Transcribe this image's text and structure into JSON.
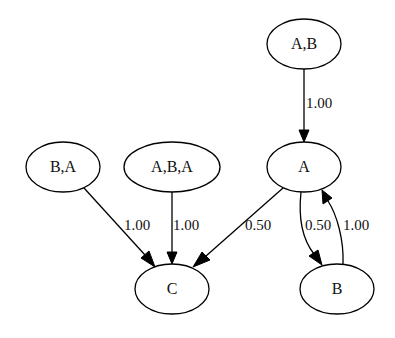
{
  "graph": {
    "type": "directed-weighted",
    "nodes": [
      {
        "id": "AB",
        "label": "A,B",
        "cx": 304,
        "cy": 44,
        "rx": 37,
        "ry": 25
      },
      {
        "id": "A",
        "label": "A",
        "cx": 304,
        "cy": 167,
        "rx": 37,
        "ry": 25
      },
      {
        "id": "BA",
        "label": "B,A",
        "cx": 63,
        "cy": 167,
        "rx": 37,
        "ry": 25
      },
      {
        "id": "ABA",
        "label": "A,B,A",
        "cx": 172,
        "cy": 167,
        "rx": 48,
        "ry": 25
      },
      {
        "id": "C",
        "label": "C",
        "cx": 172,
        "cy": 289,
        "rx": 37,
        "ry": 25
      },
      {
        "id": "B",
        "label": "B",
        "cx": 337,
        "cy": 289,
        "rx": 37,
        "ry": 25
      }
    ],
    "edges": [
      {
        "from": "A,B",
        "to": "A",
        "weight": "1.00"
      },
      {
        "from": "B,A",
        "to": "C",
        "weight": "1.00"
      },
      {
        "from": "A,B,A",
        "to": "C",
        "weight": "1.00"
      },
      {
        "from": "A",
        "to": "C",
        "weight": "0.50"
      },
      {
        "from": "A",
        "to": "B",
        "weight": "0.50"
      },
      {
        "from": "B",
        "to": "A",
        "weight": "1.00"
      }
    ]
  },
  "labels": {
    "node_ab": "A,B",
    "node_a": "A",
    "node_ba": "B,A",
    "node_aba": "A,B,A",
    "node_c": "C",
    "node_b": "B",
    "edge_ab_a": "1.00",
    "edge_ba_c": "1.00",
    "edge_aba_c": "1.00",
    "edge_a_c": "0.50",
    "edge_a_b": "0.50",
    "edge_b_a": "1.00"
  }
}
